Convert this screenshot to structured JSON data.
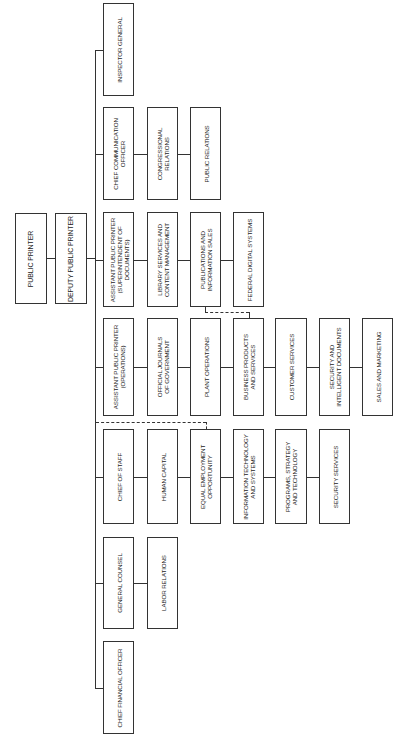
{
  "root": {
    "public_printer": "PUBLIC PRINTER",
    "deputy_public_printer": "DEPUTY PUBLIC PRINTER"
  },
  "branches": [
    {
      "id": "inspector-general",
      "head": "INSPECTOR GENERAL",
      "children": []
    },
    {
      "id": "chief-communication-officer",
      "head": "CHIEF COMMUNICATION\nOFFICER",
      "children": [
        "CONGRESSIONAL\nRELATIONS",
        "PUBLIC RELATIONS"
      ]
    },
    {
      "id": "superintendent-of-documents",
      "head": "ASSISTANT PUBLIC PRINTER\n(SUPERINTENDENT OF\nDOCUMENTS)",
      "children": [
        "LIBRARY SERVICES AND\nCONTENT MANAGEMENT",
        "PUBLICATIONS AND\nINFORMATION SALES",
        "FEDERAL DIGITAL SYSTEMS"
      ]
    },
    {
      "id": "operations",
      "head": "ASSISTANT PUBLIC PRINTER\n(OPERATIONS)",
      "children": [
        "OFFICIAL JOURNALS\nOF GOVERNMENT",
        "PLANT OPERATIONS",
        "BUSINESS PRODUCTS\nAND SERVICES",
        "CUSTOMER SERVICES",
        "SECURITY AND\nINTELLIGENT DOCUMENTS",
        "SALES AND MARKETING"
      ]
    },
    {
      "id": "chief-of-staff",
      "head": "CHIEF OF STAFF",
      "children": [
        "HUMAN CAPITAL",
        "EQUAL EMPLOYMENT\nOPPORTUNITY",
        "INFORMATION TECHNOLOGY\nAND SYSTEMS",
        "PROGRAMS, STRATEGY\nAND TECHNOLOGY",
        "SECURITY SERVICES"
      ]
    },
    {
      "id": "general-counsel",
      "head": "GENERAL COUNSEL",
      "children": [
        "LABOR RELATIONS"
      ]
    },
    {
      "id": "chief-financial-officer",
      "head": "CHIEF FINANCIAL OFFICER",
      "children": []
    }
  ],
  "dotted_links": [
    {
      "from": "CHIEF OF STAFF",
      "to": "EQUAL EMPLOYMENT OPPORTUNITY",
      "style": "dashed"
    },
    {
      "from": "PUBLICATIONS AND INFORMATION SALES",
      "to": "BUSINESS PRODUCTS AND SERVICES",
      "style": "dashed"
    }
  ],
  "colors": {
    "line": "#333333",
    "background": "#ffffff",
    "text": "#222222"
  }
}
